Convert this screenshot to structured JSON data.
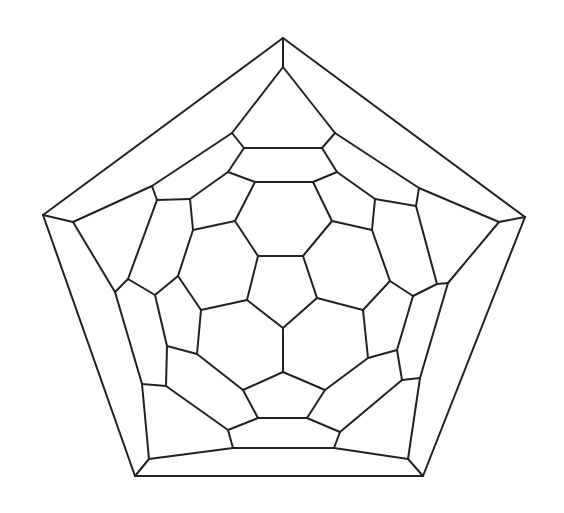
{
  "diagram": {
    "stroke_color": "#222222",
    "background_color": "#ffffff",
    "vertices": {
      "O1": [
        283,
        38
      ],
      "O2": [
        525,
        217
      ],
      "O3": [
        423,
        476
      ],
      "O4": [
        135,
        476
      ],
      "O5": [
        43,
        215
      ],
      "I1": [
        283,
        67
      ],
      "I2": [
        499,
        222
      ],
      "I3": [
        408,
        459
      ],
      "I4": [
        149,
        459
      ],
      "I5": [
        73,
        222
      ],
      "A1": [
        232,
        133
      ],
      "A2": [
        335,
        133
      ],
      "A3": [
        244,
        148
      ],
      "A4": [
        322,
        148
      ],
      "B1": [
        228,
        172
      ],
      "B2": [
        337,
        172
      ],
      "T1": [
        255,
        182
      ],
      "T2": [
        313,
        182
      ],
      "C1": [
        152,
        186
      ],
      "C2": [
        157,
        200
      ],
      "C3": [
        190,
        199
      ],
      "D1": [
        419,
        188
      ],
      "D2": [
        416,
        206
      ],
      "D3": [
        375,
        199
      ],
      "T3": [
        235,
        221
      ],
      "T4": [
        332,
        221
      ],
      "L1": [
        193,
        230
      ],
      "R1": [
        372,
        230
      ],
      "P1": [
        258,
        256
      ],
      "P2": [
        303,
        256
      ],
      "P3": [
        317,
        298
      ],
      "P4": [
        283,
        328
      ],
      "P5": [
        247,
        300
      ],
      "E1": [
        115,
        292
      ],
      "E2": [
        128,
        279
      ],
      "E3": [
        155,
        295
      ],
      "E4": [
        178,
        276
      ],
      "E5": [
        201,
        310
      ],
      "F1": [
        448,
        283
      ],
      "F2": [
        437,
        284
      ],
      "F3": [
        413,
        296
      ],
      "F4": [
        390,
        281
      ],
      "F5": [
        363,
        310
      ],
      "G1": [
        197,
        354
      ],
      "G2": [
        167,
        346
      ],
      "G3": [
        166,
        386
      ],
      "G4": [
        142,
        384
      ],
      "H1": [
        368,
        358
      ],
      "H2": [
        397,
        350
      ],
      "H3": [
        402,
        380
      ],
      "H4": [
        420,
        378
      ],
      "K1": [
        283,
        372
      ],
      "K2": [
        243,
        390
      ],
      "K3": [
        325,
        390
      ],
      "K4": [
        258,
        418
      ],
      "K5": [
        307,
        418
      ],
      "K6": [
        228,
        430
      ],
      "K7": [
        340,
        432
      ],
      "K8": [
        233,
        448
      ],
      "K9": [
        334,
        448
      ]
    },
    "edges": [
      [
        "O1",
        "O2"
      ],
      [
        "O2",
        "O3"
      ],
      [
        "O3",
        "O4"
      ],
      [
        "O4",
        "O5"
      ],
      [
        "O5",
        "O1"
      ],
      [
        "O1",
        "I1"
      ],
      [
        "O2",
        "I2"
      ],
      [
        "O3",
        "I3"
      ],
      [
        "O4",
        "I4"
      ],
      [
        "O5",
        "I5"
      ],
      [
        "I1",
        "A1"
      ],
      [
        "I1",
        "A2"
      ],
      [
        "A1",
        "C1"
      ],
      [
        "C1",
        "I5"
      ],
      [
        "A2",
        "D1"
      ],
      [
        "D1",
        "I2"
      ],
      [
        "I5",
        "E1"
      ],
      [
        "E1",
        "G4"
      ],
      [
        "G4",
        "I4"
      ],
      [
        "I2",
        "F1"
      ],
      [
        "F1",
        "H4"
      ],
      [
        "H4",
        "I3"
      ],
      [
        "I4",
        "K8"
      ],
      [
        "K8",
        "K9"
      ],
      [
        "K9",
        "I3"
      ],
      [
        "A1",
        "A3"
      ],
      [
        "A2",
        "A4"
      ],
      [
        "A3",
        "A4"
      ],
      [
        "A3",
        "B1"
      ],
      [
        "A4",
        "B2"
      ],
      [
        "B1",
        "T1"
      ],
      [
        "B2",
        "T2"
      ],
      [
        "T1",
        "T2"
      ],
      [
        "B1",
        "C3"
      ],
      [
        "C3",
        "C2"
      ],
      [
        "C2",
        "C1"
      ],
      [
        "B2",
        "D3"
      ],
      [
        "D3",
        "D2"
      ],
      [
        "D2",
        "D1"
      ],
      [
        "T1",
        "T3"
      ],
      [
        "T2",
        "T4"
      ],
      [
        "T3",
        "P1"
      ],
      [
        "T4",
        "P2"
      ],
      [
        "P1",
        "P2"
      ],
      [
        "P2",
        "P3"
      ],
      [
        "P3",
        "P4"
      ],
      [
        "P4",
        "P5"
      ],
      [
        "P5",
        "P1"
      ],
      [
        "T3",
        "L1"
      ],
      [
        "L1",
        "C3"
      ],
      [
        "T4",
        "R1"
      ],
      [
        "R1",
        "D3"
      ],
      [
        "C2",
        "E2"
      ],
      [
        "E2",
        "E1"
      ],
      [
        "E2",
        "E3"
      ],
      [
        "E3",
        "E4"
      ],
      [
        "E4",
        "L1"
      ],
      [
        "E4",
        "E5"
      ],
      [
        "E5",
        "P5"
      ],
      [
        "D2",
        "F2"
      ],
      [
        "F2",
        "F1"
      ],
      [
        "F2",
        "F3"
      ],
      [
        "F3",
        "F4"
      ],
      [
        "F4",
        "R1"
      ],
      [
        "F4",
        "F5"
      ],
      [
        "F5",
        "P3"
      ],
      [
        "E3",
        "G2"
      ],
      [
        "G2",
        "G1"
      ],
      [
        "G1",
        "E5"
      ],
      [
        "G2",
        "G3"
      ],
      [
        "G3",
        "G4"
      ],
      [
        "G3",
        "K6"
      ],
      [
        "F3",
        "H2"
      ],
      [
        "H2",
        "H1"
      ],
      [
        "H1",
        "F5"
      ],
      [
        "H2",
        "H3"
      ],
      [
        "H3",
        "H4"
      ],
      [
        "H3",
        "K7"
      ],
      [
        "P4",
        "K1"
      ],
      [
        "K1",
        "K2"
      ],
      [
        "K1",
        "K3"
      ],
      [
        "K2",
        "G1"
      ],
      [
        "K3",
        "H1"
      ],
      [
        "K2",
        "K4"
      ],
      [
        "K3",
        "K5"
      ],
      [
        "K4",
        "K5"
      ],
      [
        "K4",
        "K6"
      ],
      [
        "K5",
        "K7"
      ],
      [
        "K6",
        "K8"
      ],
      [
        "K7",
        "K9"
      ]
    ]
  }
}
